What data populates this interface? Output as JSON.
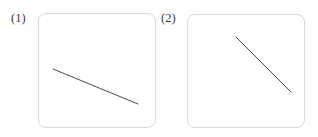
{
  "figure": {
    "background_color": "#ffffff",
    "width": 318,
    "height": 137,
    "box_border_color": "#d9d9d9",
    "line_color": "#4a4a4a"
  },
  "panels": [
    {
      "label": "(1)",
      "label_x": 11,
      "label_y": 12,
      "box": {
        "x": 38,
        "y": 13,
        "width": 118,
        "height": 115,
        "radius": 8
      },
      "line": {
        "x1": 53,
        "y1": 69,
        "x2": 138,
        "y2": 104
      }
    },
    {
      "label": "(2)",
      "label_x": 161,
      "label_y": 12,
      "box": {
        "x": 187,
        "y": 14,
        "width": 118,
        "height": 114,
        "radius": 8
      },
      "line": {
        "x1": 236,
        "y1": 37,
        "x2": 291,
        "y2": 92
      }
    }
  ],
  "chart_data": {
    "type": "line",
    "title": "",
    "xlabel": "",
    "ylabel": "",
    "grid": false,
    "legend": "none",
    "panel_layout": "1x2",
    "panels": [
      {
        "label": "(1)",
        "type": "line",
        "x": [
          0,
          1
        ],
        "y": [
          1,
          0
        ],
        "slope_description": "shallow negative slope",
        "slope_pixels": 0.412,
        "series": [
          {
            "name": "segment-1",
            "x": [
              53,
              138
            ],
            "y": [
              69,
              104
            ]
          }
        ]
      },
      {
        "label": "(2)",
        "type": "line",
        "x": [
          0,
          1
        ],
        "y": [
          1,
          0
        ],
        "slope_description": "steep negative slope",
        "slope_pixels": 1.0,
        "series": [
          {
            "name": "segment-2",
            "x": [
              236,
              291
            ],
            "y": [
              37,
              92
            ]
          }
        ]
      }
    ]
  }
}
